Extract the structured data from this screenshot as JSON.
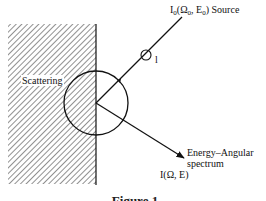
{
  "diagram": {
    "labels": {
      "scattering": "Scattering",
      "source": "I₀(Ω₀, E₀) Source",
      "source_short": "Source",
      "spectrum_line1": "Energy–Angular",
      "spectrum_line2": "spectrum",
      "intensity": "I(Ω, E)",
      "length_symbol": "l"
    },
    "caption": "Figure 1",
    "colors": {
      "line": "#111111",
      "hatch": "#555555",
      "background": "#ffffff"
    }
  }
}
